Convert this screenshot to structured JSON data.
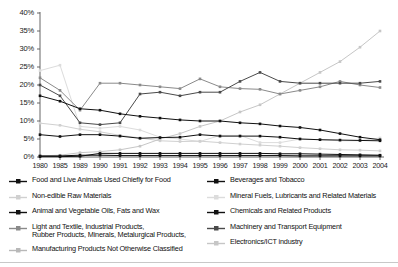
{
  "chart_data": {
    "type": "line",
    "title": "",
    "subtitle": "",
    "xlabel": "",
    "ylabel": "",
    "ylim": [
      0,
      40
    ],
    "ytick_labels": [
      "0%",
      "5%",
      "10%",
      "15%",
      "20%",
      "25%",
      "30%",
      "35%",
      "40%"
    ],
    "ytick_values": [
      0,
      5,
      10,
      15,
      20,
      25,
      30,
      35,
      40
    ],
    "grid": false,
    "legend_position": "bottom",
    "categories": [
      "1980",
      "1985",
      "1989",
      "1990",
      "1991",
      "1992",
      "1993",
      "1994",
      "1995",
      "1996",
      "1997",
      "1998",
      "1999",
      "2000",
      "2001",
      "2002",
      "2003",
      "2004"
    ],
    "series": [
      {
        "name": "Food and Live Animals Used Chiefly for Food",
        "color": "#111111",
        "marker": "square",
        "values": [
          17.0,
          15.5,
          13.4,
          13.0,
          12.0,
          11.3,
          10.8,
          10.3,
          10.0,
          10.0,
          9.5,
          9.2,
          8.6,
          8.2,
          7.5,
          6.5,
          5.5,
          4.8
        ]
      },
      {
        "name": "Non-edible Raw Materials",
        "color": "#d0d0d0",
        "marker": "square",
        "values": [
          9.4,
          8.8,
          7.7,
          7.0,
          6.0,
          5.3,
          4.5,
          4.3,
          4.4,
          4.0,
          3.6,
          3.3,
          3.0,
          2.6,
          2.3,
          2.0,
          1.9,
          1.7
        ]
      },
      {
        "name": "Animal and Vegetable Oils, Fats and Wax",
        "color": "#111111",
        "marker": "square",
        "values": [
          0.3,
          0.3,
          0.5,
          0.5,
          0.4,
          0.4,
          0.4,
          0.4,
          0.4,
          0.4,
          0.4,
          0.4,
          0.4,
          0.3,
          0.3,
          0.3,
          0.3,
          0.3
        ]
      },
      {
        "name": "Light and Textile, Industrial Products,\nRubber Products, Minerals, Metalurgical Products,",
        "color": "#8a8a8a",
        "marker": "square",
        "values": [
          22.0,
          18.5,
          13.0,
          20.5,
          20.5,
          20.0,
          19.5,
          19.0,
          21.7,
          19.5,
          19.0,
          18.8,
          17.5,
          18.5,
          19.5,
          21.0,
          20.0,
          19.3
        ]
      },
      {
        "name": "Manufacturing Products Not Otherwise Classified",
        "color": "#b8b8b8",
        "marker": "square",
        "values": [
          0.2,
          0.2,
          0.3,
          0.3,
          0.3,
          0.4,
          0.4,
          0.4,
          0.4,
          0.4,
          0.4,
          0.4,
          0.4,
          0.4,
          0.4,
          0.4,
          0.4,
          0.4
        ]
      },
      {
        "name": "Beverages and Tobacco",
        "color": "#111111",
        "marker": "square",
        "values": [
          0.1,
          0.1,
          0.2,
          1.0,
          1.0,
          1.0,
          1.0,
          1.0,
          1.0,
          1.0,
          1.0,
          1.0,
          0.9,
          0.9,
          0.8,
          0.7,
          0.6,
          0.5
        ]
      },
      {
        "name": "Mineral Fuels, Lubricants and Related Materials",
        "color": "#dcdcdc",
        "marker": "square",
        "values": [
          24.0,
          25.5,
          8.5,
          8.0,
          8.5,
          7.5,
          5.5,
          5.0,
          4.3,
          6.0,
          6.0,
          4.0,
          4.0,
          5.0,
          4.8,
          4.5,
          4.5,
          5.3
        ]
      },
      {
        "name": "Chemicals and Related Products",
        "color": "#111111",
        "marker": "square",
        "values": [
          6.2,
          5.7,
          6.2,
          6.2,
          5.8,
          5.2,
          5.4,
          5.5,
          6.2,
          5.8,
          5.8,
          5.8,
          5.5,
          5.0,
          4.8,
          4.7,
          4.6,
          4.5
        ]
      },
      {
        "name": "Machinery and Transport Equipment",
        "color": "#4a4a4a",
        "marker": "square",
        "values": [
          20.0,
          17.0,
          9.5,
          9.0,
          9.5,
          17.5,
          18.0,
          17.0,
          18.0,
          18.0,
          21.0,
          23.5,
          21.0,
          20.5,
          20.5,
          20.5,
          20.5,
          21.0
        ]
      },
      {
        "name": "Electronics/ICT industry",
        "color": "#c6c6c6",
        "marker": "square",
        "values": [
          0.3,
          0.5,
          1.2,
          1.5,
          2.0,
          3.0,
          5.0,
          6.5,
          8.5,
          10.0,
          12.5,
          14.5,
          17.5,
          20.5,
          23.5,
          26.5,
          30.5,
          35.0
        ]
      }
    ]
  },
  "legend": {
    "left_items": [
      "Food and Live Animals Used Chiefly for Food",
      "Non-edible Raw Materials",
      "Animal and Vegetable Oils, Fats and Wax",
      "Light and Textile, Industrial Products,\nRubber Products, Minerals, Metalurgical Products,",
      "Manufacturing Products Not Otherwise Classified"
    ],
    "right_items": [
      "Beverages and Tobacco",
      "Mineral Fuels, Lubricants and Related Materials",
      "Chemicals and Related Products",
      "Machinery and Transport Equipment",
      "Electronics/ICT industry"
    ]
  }
}
